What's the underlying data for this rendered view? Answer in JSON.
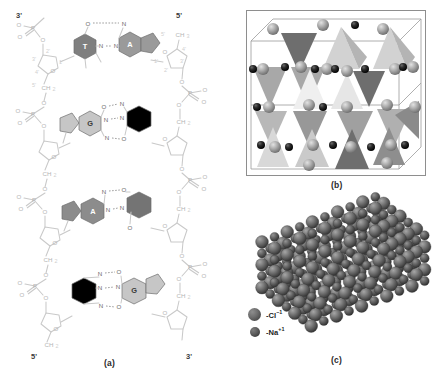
{
  "figure": {
    "background_color": "#ffffff",
    "width": 442,
    "height": 381
  },
  "panel_a": {
    "caption": "(a)",
    "title_semantic": "dna-double-helix-base-pairing",
    "end_labels": {
      "top_left": "3'",
      "top_right": "5'",
      "bottom_left": "5'",
      "bottom_right": "3'"
    },
    "base_pairs": [
      {
        "index": 1,
        "left_base": "T",
        "right_base": "A",
        "hydrogen_bonds": 2,
        "left_color": "#7f7f7f",
        "right_color": "#9a9a9a",
        "bond_atoms": [
          "O",
          "N",
          "N",
          "N"
        ]
      },
      {
        "index": 2,
        "left_base": "G",
        "right_base": "C",
        "hydrogen_bonds": 3,
        "left_color": "#c6c6c6",
        "right_color": "#000000",
        "bond_atoms": [
          "O",
          "N",
          "N",
          "N",
          "N",
          "O"
        ]
      },
      {
        "index": 3,
        "left_base": "A",
        "right_base": "T",
        "hydrogen_bonds": 2,
        "left_color": "#8c8c8c",
        "right_color": "#747474",
        "bond_atoms": [
          "N",
          "O",
          "N",
          "N"
        ]
      },
      {
        "index": 4,
        "left_base": "C",
        "right_base": "G",
        "hydrogen_bonds": 3,
        "left_color": "#000000",
        "right_color": "#c6c6c6",
        "bond_atoms": [
          "N",
          "O",
          "N",
          "N",
          "N",
          "O"
        ]
      }
    ],
    "backbone_atom_labels": [
      "P",
      "O",
      "O",
      "O",
      "O",
      "CH",
      "O",
      "P",
      "O",
      "O"
    ],
    "sugar_carbon_numbers": [
      "1'",
      "2'",
      "3'",
      "4'",
      "5'"
    ],
    "methylene_label": "CH",
    "methylene_subscript": "2",
    "phosphorus_label": "P",
    "oxygen_label": "O",
    "nitrogen_label": "N"
  },
  "panel_b": {
    "caption": "(b)",
    "title_semantic": "silicate-tetrahedra-unit-cell",
    "colors": {
      "tetra_light": "#d2d2d2",
      "tetra_mid": "#a8a8a8",
      "tetra_dark": "#868686",
      "tetra_darker": "#6e6e6e",
      "cell_edge": "#8e8e8e",
      "sphere_large": "#9a9a9a",
      "sphere_small": "#1a1a1a"
    },
    "tetrahedra_count": 16,
    "large_sphere_count": 24,
    "small_sphere_count": 14
  },
  "panel_c": {
    "caption": "(c)",
    "title_semantic": "sodium-chloride-ionic-crystal",
    "legend": [
      {
        "symbol": "Cl",
        "charge": "-1",
        "label_prefix": "-",
        "size": "large",
        "color": "#6e6e6e"
      },
      {
        "symbol": "Na",
        "charge": "+1",
        "label_prefix": "-",
        "size": "small",
        "color": "#5c5c5c"
      }
    ],
    "legend_items_text": [
      "-Cl-1",
      "-Na+1"
    ],
    "lattice": {
      "rows": 7,
      "cols": 10,
      "layers": 5,
      "sphere_color": "#6b6b6b"
    }
  }
}
